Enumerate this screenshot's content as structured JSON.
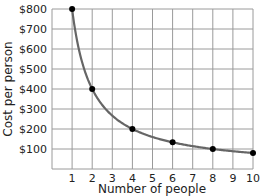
{
  "chart_data": {
    "type": "line",
    "title": "",
    "xlabel": "Number of people",
    "ylabel": "Cost per person",
    "x_ticks": [
      "1",
      "2",
      "3",
      "4",
      "5",
      "6",
      "7",
      "8",
      "9",
      "10"
    ],
    "y_ticks": [
      "$100",
      "$200",
      "$300",
      "$400",
      "$500",
      "$600",
      "$700",
      "$800"
    ],
    "xlim": [
      0,
      10
    ],
    "ylim": [
      0,
      800
    ],
    "grid": true,
    "legend": null,
    "curve": "y = 800 / x",
    "series": [
      {
        "name": "Cost per person",
        "x": [
          1,
          2,
          4,
          6,
          8,
          10
        ],
        "values": [
          800,
          400,
          200,
          133.33,
          100,
          80
        ],
        "marked_points": true,
        "color": "#666666"
      }
    ],
    "colors": {
      "curve": "#666666",
      "points": "#000000",
      "grid": "#9a9a9a"
    }
  }
}
